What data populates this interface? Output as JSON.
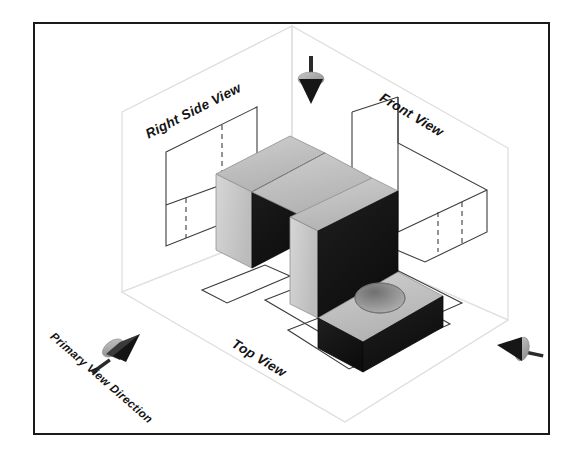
{
  "diagram": {
    "type": "third-angle-projection-illustration",
    "labels": {
      "right_side_view": "Right Side View",
      "front_view": "Front View",
      "top_view": "Top View",
      "primary_view_direction": "Primary View Direction"
    },
    "icons": {
      "top_arrow": "down-arrow-cone-icon",
      "right_arrow": "left-arrow-cone-icon",
      "primary_arrow": "up-right-arrow-cone-icon"
    },
    "colors": {
      "frame_border": "#1a1a1a",
      "plane_outline": "#d9d9d9",
      "view_outline": "#3a3a3a",
      "hidden_line": "#3a3a3a",
      "solid_top_face": "#bdbdbd",
      "solid_left_face": "#cfcfcf",
      "solid_front_face": "#161616",
      "hole_inner": "#8e8e8e",
      "arrow_light": "#a8a8a8",
      "arrow_dark": "#1c1c1c",
      "background": "#ffffff",
      "text": "#141414"
    },
    "planes": [
      {
        "name": "right-side-view-plane",
        "label": "Right Side View",
        "position": "upper-left",
        "contains": [
          "outer-rectangle",
          "vertical-hidden-line",
          "horizontal-division-line"
        ]
      },
      {
        "name": "front-view-plane",
        "label": "Front View",
        "position": "upper-right",
        "contains": [
          "l-shape-outline",
          "vertical-division-line",
          "two-hidden-hole-lines"
        ]
      },
      {
        "name": "top-view-plane",
        "label": "Top View",
        "position": "lower-center",
        "contains": [
          "outer-rectangle",
          "inner-rectangle",
          "hole-circle",
          "narrow-rectangle"
        ]
      }
    ],
    "object": {
      "name": "l-shaped-bracket",
      "features": [
        "vertical-wall",
        "horizontal-base",
        "through-hole"
      ],
      "hole_count": 1
    },
    "arrows": [
      {
        "name": "top-arrow",
        "direction": "down",
        "target_plane": "top-view-plane"
      },
      {
        "name": "right-arrow",
        "direction": "left",
        "target_plane": "right-side-view-plane"
      },
      {
        "name": "primary-arrow",
        "direction": "up-right",
        "target_plane": "front-view-plane"
      }
    ]
  }
}
